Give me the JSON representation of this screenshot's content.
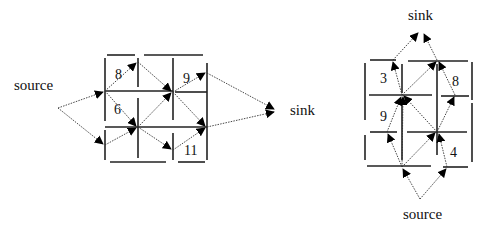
{
  "left_diagram": {
    "source_label": "source",
    "sink_label": "sink",
    "edge_weights": [
      "8",
      "6",
      "9",
      "11"
    ]
  },
  "right_diagram": {
    "source_label": "source",
    "sink_label": "sink",
    "edge_weights": [
      "3",
      "9",
      "8",
      "4"
    ]
  },
  "colors": {
    "ink": "#111111",
    "background": "#ffffff"
  }
}
